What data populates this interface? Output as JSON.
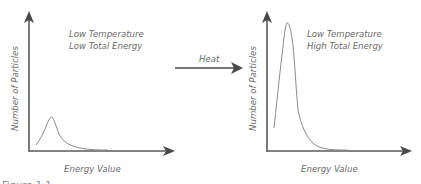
{
  "left_chart": {
    "title_line1": "Low Temperature",
    "title_line2": "Low Total Energy",
    "y_label": "Number of Particles",
    "x_label": "Energy Value"
  },
  "transition": {
    "label": "Heat"
  },
  "right_chart": {
    "title_line1": "Low Temperature",
    "title_line2": "High Total Energy",
    "y_label": "Number of Particles",
    "x_label": "Energy Value"
  },
  "caption": {
    "partial_text": "Figure 1.1"
  },
  "colors": {
    "axis": "#5a5a5a",
    "curve": "#8a8a8a",
    "text": "#6b6b6b"
  }
}
